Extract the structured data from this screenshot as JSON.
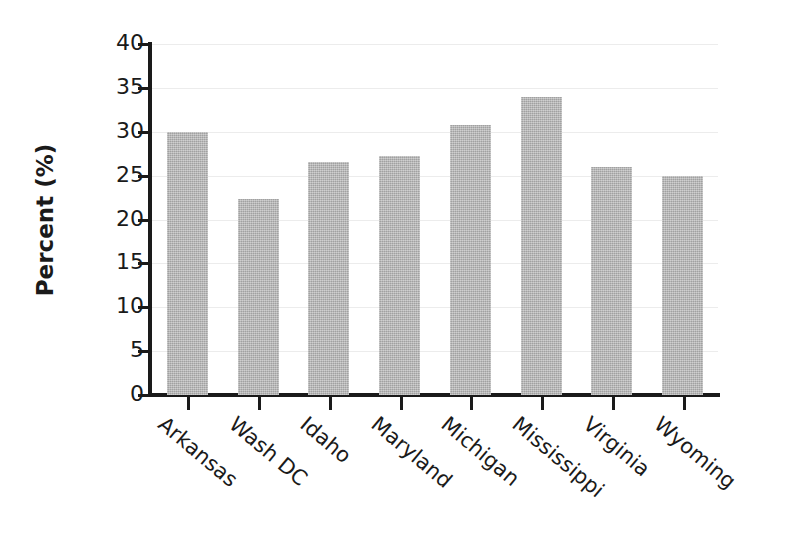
{
  "chart_data": {
    "type": "bar",
    "title": "",
    "xlabel": "",
    "ylabel": "Percent (%)",
    "categories": [
      "Arkansas",
      "Wash DC",
      "Idaho",
      "Maryland",
      "Michigan",
      "Mississippi",
      "Virginia",
      "Wyoming"
    ],
    "values": [
      30.0,
      22.3,
      26.6,
      27.2,
      30.8,
      34.0,
      26.0,
      25.0
    ],
    "ylim": [
      0,
      40
    ],
    "yticks": [
      0,
      5,
      10,
      15,
      20,
      25,
      30,
      35,
      40
    ],
    "ytick_labels": [
      "0",
      "5",
      "10",
      "15",
      "20",
      "25",
      "30",
      "35",
      "40"
    ],
    "grid": true,
    "legend": false,
    "bar_color": "#b4b4b4",
    "axis_color": "#1a1a1a",
    "grid_color": "#ececec",
    "xlabel_rotation": 40
  }
}
